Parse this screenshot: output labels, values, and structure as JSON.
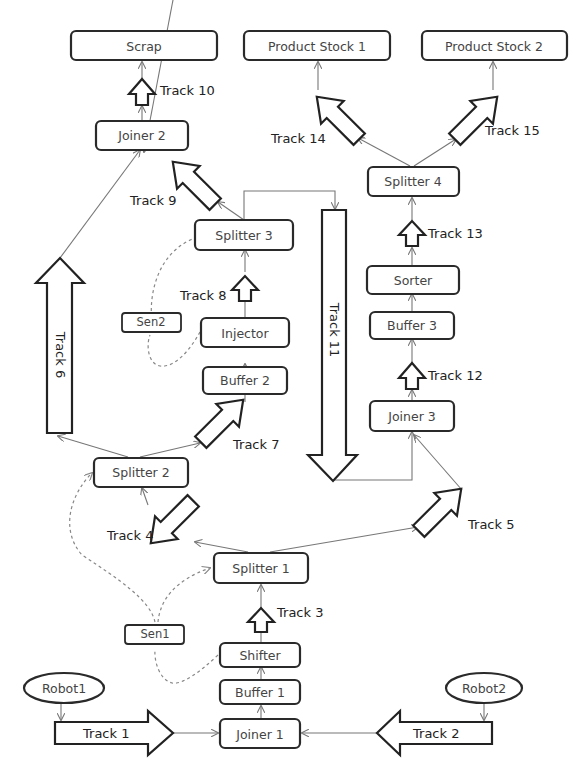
{
  "diagram": {
    "type": "production-line-flow",
    "nodes": {
      "scrap": "Scrap",
      "product_stock_1": "Product Stock 1",
      "product_stock_2": "Product Stock 2",
      "joiner_1": "Joiner 1",
      "joiner_2": "Joiner 2",
      "joiner_3": "Joiner 3",
      "splitter_1": "Splitter 1",
      "splitter_2": "Splitter 2",
      "splitter_3": "Splitter 3",
      "splitter_4": "Splitter 4",
      "buffer_1": "Buffer 1",
      "buffer_2": "Buffer  2",
      "buffer_3": "Buffer  3",
      "shifter": "Shifter",
      "injector": "Injector",
      "sorter": "Sorter",
      "sen1": "Sen1",
      "sen2": "Sen2",
      "robot1": "Robot1",
      "robot2": "Robot2"
    },
    "tracks": {
      "track_1": "Track 1",
      "track_2": "Track 2",
      "track_3": "Track 3",
      "track_4": "Track 4",
      "track_5": "Track 5",
      "track_6": "Track 6",
      "track_7": "Track 7",
      "track_8": "Track 8",
      "track_9": "Track 9",
      "track_10": "Track 10",
      "track_11": "Track 11",
      "track_12": "Track 12",
      "track_13": "Track 13",
      "track_14": "Track 14",
      "track_15": "Track 15"
    },
    "edges": [
      {
        "from": "Robot1",
        "to": "Track 1"
      },
      {
        "from": "Track 1",
        "to": "Joiner 1"
      },
      {
        "from": "Robot2",
        "to": "Track 2"
      },
      {
        "from": "Track 2",
        "to": "Joiner 1"
      },
      {
        "from": "Joiner 1",
        "to": "Buffer 1"
      },
      {
        "from": "Buffer 1",
        "to": "Shifter"
      },
      {
        "from": "Shifter",
        "to": "Track 3"
      },
      {
        "from": "Track 3",
        "to": "Splitter 1"
      },
      {
        "from": "Splitter 1",
        "to": "Track 4"
      },
      {
        "from": "Splitter 1",
        "to": "Track 5"
      },
      {
        "from": "Track 4",
        "to": "Splitter 2"
      },
      {
        "from": "Track 5",
        "to": "Joiner 3"
      },
      {
        "from": "Splitter 2",
        "to": "Track 6"
      },
      {
        "from": "Splitter 2",
        "to": "Track 7"
      },
      {
        "from": "Track 6",
        "to": "Joiner 2"
      },
      {
        "from": "Track 7",
        "to": "Buffer 2"
      },
      {
        "from": "Buffer 2",
        "to": "Injector"
      },
      {
        "from": "Injector",
        "to": "Track 8"
      },
      {
        "from": "Track 8",
        "to": "Splitter 3"
      },
      {
        "from": "Splitter 3",
        "to": "Track 9"
      },
      {
        "from": "Splitter 3",
        "to": "Track 11"
      },
      {
        "from": "Track 9",
        "to": "Joiner 2"
      },
      {
        "from": "Joiner 2",
        "to": "Track 10"
      },
      {
        "from": "Track 10",
        "to": "Scrap"
      },
      {
        "from": "Track 11",
        "to": "Joiner 3"
      },
      {
        "from": "Joiner 3",
        "to": "Track 12"
      },
      {
        "from": "Track 12",
        "to": "Buffer 3"
      },
      {
        "from": "Buffer 3",
        "to": "Sorter"
      },
      {
        "from": "Sorter",
        "to": "Track 13"
      },
      {
        "from": "Track 13",
        "to": "Splitter 4"
      },
      {
        "from": "Splitter 4",
        "to": "Track 14"
      },
      {
        "from": "Splitter 4",
        "to": "Track 15"
      },
      {
        "from": "Track 14",
        "to": "Product Stock 1"
      },
      {
        "from": "Track 15",
        "to": "Product Stock 2"
      }
    ],
    "sensor_links": [
      {
        "from": "Shifter",
        "via": "Sen1",
        "to": [
          "Splitter 1",
          "Splitter 2"
        ]
      },
      {
        "from": "Injector",
        "via": "Sen2",
        "to": [
          "Splitter 3"
        ]
      }
    ]
  }
}
